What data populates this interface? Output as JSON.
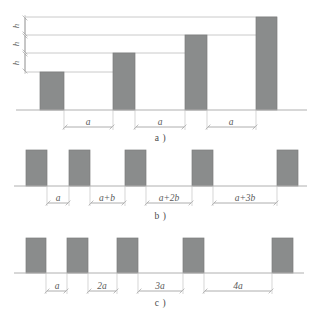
{
  "figure": {
    "type": "technical-diagram",
    "bar_fill": "#8a8c8c",
    "bar_stroke": "#7b7d7d",
    "line_color": "#b9b9b9",
    "baseline_color": "#b0b0b0",
    "text_color": "#5a5a5a",
    "background": "#ffffff"
  },
  "panels": [
    {
      "id": "a",
      "caption": "a )",
      "height_labels": [
        "h",
        "h",
        "h"
      ],
      "gap_labels": [
        "a",
        "a",
        "a"
      ],
      "bars": [
        {
          "index": 1,
          "x": 40,
          "width": 24,
          "top": 72,
          "height_steps": 1
        },
        {
          "index": 2,
          "x": 113,
          "width": 22,
          "top": 53,
          "height_steps": 2
        },
        {
          "index": 3,
          "x": 185,
          "width": 22,
          "top": 35,
          "height_steps": 3
        },
        {
          "index": 4,
          "x": 256,
          "width": 21,
          "top": 17,
          "height_steps": 4
        }
      ],
      "baseline_y": 110,
      "reference_lines_y": [
        17,
        35,
        53,
        72
      ]
    },
    {
      "id": "b",
      "caption": "b )",
      "gap_labels": [
        "a",
        "a+b",
        "a+2b",
        "a+3b"
      ],
      "bars": [
        {
          "index": 1,
          "x": 26,
          "width": 21
        },
        {
          "index": 2,
          "x": 69,
          "width": 21
        },
        {
          "index": 3,
          "x": 125,
          "width": 21
        },
        {
          "index": 4,
          "x": 192,
          "width": 21
        },
        {
          "index": 5,
          "x": 277,
          "width": 21
        }
      ],
      "bar_top": 150,
      "baseline_y": 186
    },
    {
      "id": "c",
      "caption": "c )",
      "gap_labels": [
        "a",
        "2a",
        "3a",
        "4a"
      ],
      "bars": [
        {
          "index": 1,
          "x": 26,
          "width": 20
        },
        {
          "index": 2,
          "x": 67,
          "width": 21
        },
        {
          "index": 3,
          "x": 117,
          "width": 21
        },
        {
          "index": 4,
          "x": 183,
          "width": 21
        },
        {
          "index": 5,
          "x": 272,
          "width": 21
        }
      ],
      "bar_top": 238,
      "baseline_y": 273
    }
  ],
  "bottom_caption": {
    "text": "",
    "note": "cut off at image edge"
  }
}
